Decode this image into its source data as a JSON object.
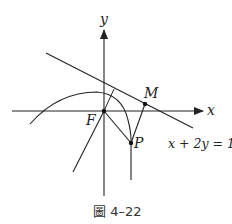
{
  "figure": {
    "caption": "圖 4–22",
    "labels": {
      "y_axis": "y",
      "x_axis": "x",
      "focus": "F",
      "point_m": "M",
      "point_p": "P",
      "line_equation": "x + 2y = 1"
    },
    "colors": {
      "stroke": "#222222",
      "background": "#ffffff"
    }
  }
}
